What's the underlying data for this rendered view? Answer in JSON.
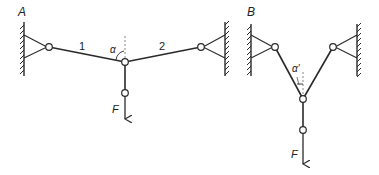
{
  "diagram": {
    "type": "two-bar truss under vertical load",
    "colors": {
      "line": "#2a2a2a",
      "dash": "#888888",
      "background": "#ffffff"
    },
    "panel_a": {
      "label": "A",
      "bar_labels": [
        "1",
        "2"
      ],
      "angle_label": "α",
      "force_label": "F"
    },
    "panel_b": {
      "label": "B",
      "angle_label": "α′",
      "force_label": "F"
    }
  }
}
